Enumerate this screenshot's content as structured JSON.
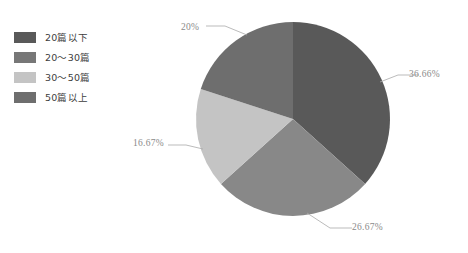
{
  "legend": {
    "position": "left",
    "items": [
      {
        "label": "20篇以下",
        "color": "#595959",
        "swatch_name": "legend-swatch-20-or-less"
      },
      {
        "label": "20～30篇",
        "color": "#777777",
        "swatch_name": "legend-swatch-20-to-30"
      },
      {
        "label": "30～50篇",
        "color": "#c4c4c4",
        "swatch_name": "legend-swatch-30-to-50"
      },
      {
        "label": "50篇以上",
        "color": "#6e6e6e",
        "swatch_name": "legend-swatch-50-or-more"
      }
    ]
  },
  "labels": {
    "top_left": "20%",
    "right": "36.66%",
    "bottom": "26.67%",
    "left": "16.67%"
  },
  "chart_data": {
    "type": "pie",
    "title": "",
    "categories": [
      "20篇以下",
      "20～30篇",
      "30～50篇",
      "50篇以上"
    ],
    "values": [
      36.66,
      26.67,
      16.67,
      20
    ],
    "value_labels": [
      "36.66%",
      "26.67%",
      "16.67%",
      "20%"
    ],
    "colors": [
      "#595959",
      "#888888",
      "#c4c4c4",
      "#6e6e6e"
    ],
    "units": "percent",
    "start_angle_deg": 0,
    "direction": "clockwise",
    "legend_position": "left",
    "grid": false,
    "xlabel": "",
    "ylabel": "",
    "center": {
      "x": 293,
      "y": 119
    },
    "radius": 97
  }
}
